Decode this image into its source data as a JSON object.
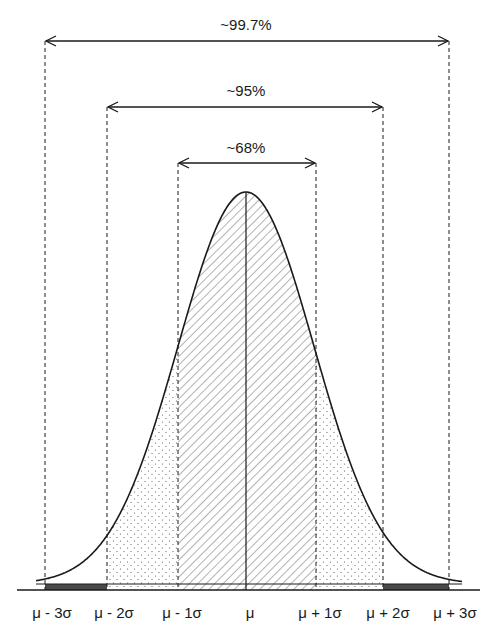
{
  "ranges": [
    {
      "label": "~68%",
      "from": "μ - 1σ",
      "to": "μ + 1σ"
    },
    {
      "label": "~95%",
      "from": "μ - 2σ",
      "to": "μ + 2σ"
    },
    {
      "label": "~99.7%",
      "from": "μ - 3σ",
      "to": "μ + 3σ"
    }
  ],
  "axis_labels": [
    "μ - 3σ",
    "μ - 2σ",
    "μ - 1σ",
    "μ",
    "μ + 1σ",
    "μ + 2σ",
    "μ + 3σ"
  ],
  "regions": {
    "within_1sigma": "hatched",
    "between_1_and_2sigma": "dotted",
    "between_2_and_3sigma": "solid dark band"
  },
  "colors": {
    "line": "#1a1a1a",
    "hatch": "#555555",
    "dark_band": "#4a4a4a"
  }
}
